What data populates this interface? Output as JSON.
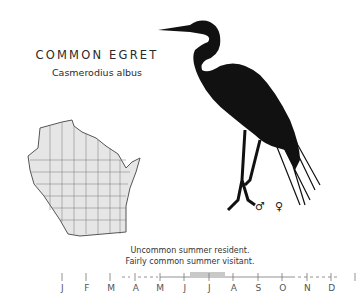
{
  "header": {
    "common_name": "COMMON EGRET",
    "scientific_name": "Casmerodius albus"
  },
  "illustration": {
    "subject": "egret-silhouette",
    "sex_symbols": [
      "♂",
      "♀"
    ]
  },
  "map": {
    "region": "Wisconsin county map"
  },
  "status": {
    "line1": "Uncommon summer resident.",
    "line2": "Fairly common summer visitant."
  },
  "timeline": {
    "months": [
      "J",
      "F",
      "M",
      "A",
      "M",
      "J",
      "J",
      "A",
      "S",
      "O",
      "N",
      "D"
    ]
  }
}
